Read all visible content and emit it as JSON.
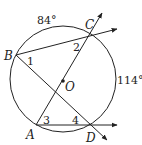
{
  "diagram": {
    "type": "circle-geometry",
    "circle": {
      "center": "O",
      "cx": 63,
      "cy": 79,
      "r": 53
    },
    "points": [
      {
        "name": "B",
        "x": 16,
        "y": 55,
        "label": "B",
        "lx": 4,
        "ly": 60
      },
      {
        "name": "C",
        "x": 91,
        "y": 34,
        "label": "C",
        "lx": 85,
        "ly": 29
      },
      {
        "name": "A",
        "x": 36,
        "y": 125,
        "label": "A",
        "lx": 26,
        "ly": 138
      },
      {
        "name": "D",
        "x": 92,
        "y": 125,
        "label": "D",
        "lx": 87,
        "ly": 141
      },
      {
        "name": "O",
        "x": 63,
        "y": 81,
        "label": "O",
        "lx": 65,
        "ly": 91
      }
    ],
    "angle_labels": [
      {
        "id": "1",
        "text": "1",
        "x": 27,
        "y": 65
      },
      {
        "id": "2",
        "text": "2",
        "x": 73,
        "y": 51
      },
      {
        "id": "3",
        "text": "3",
        "x": 43,
        "y": 124
      },
      {
        "id": "4",
        "text": "4",
        "x": 72,
        "y": 124
      }
    ],
    "arc_labels": [
      {
        "arc": "BC",
        "text": "84°",
        "x": 37,
        "y": 24
      },
      {
        "arc": "CD",
        "text": "114°",
        "x": 117,
        "y": 84
      }
    ],
    "segments": [
      "BC",
      "BD",
      "AC",
      "AD"
    ],
    "rays": [
      {
        "from": "B",
        "through": "C",
        "arrow_to": [
          118,
          29
        ]
      },
      {
        "from": "A",
        "through": "C",
        "arrow_to": [
          103,
          12
        ]
      },
      {
        "from": "A",
        "through": "D",
        "arrow_to": [
          118,
          125
        ]
      },
      {
        "from": "B",
        "through": "D",
        "arrow_to": [
          108,
          141
        ]
      }
    ],
    "stroke_color": "#222222"
  },
  "labels": {
    "B": "B",
    "C": "C",
    "A": "A",
    "D": "D",
    "O": "O",
    "angle1": "1",
    "angle2": "2",
    "angle3": "3",
    "angle4": "4",
    "arcBC": "84°",
    "arcCD": "114°"
  }
}
